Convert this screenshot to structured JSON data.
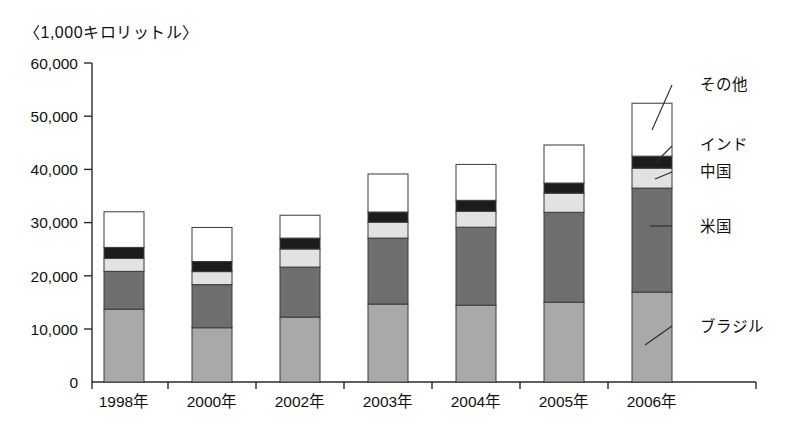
{
  "chart_data": {
    "type": "bar",
    "subtype": "stacked-bar",
    "title": "〈1,000キロリットル〉",
    "unit_note": "〈1,000キロリットル〉",
    "xlabel": "",
    "ylabel": "",
    "ylim": [
      0,
      60000
    ],
    "ytick_labels": [
      "60,000",
      "50,000",
      "40,000",
      "30,000",
      "20,000",
      "10,000",
      "0"
    ],
    "ytick_values": [
      60000,
      50000,
      40000,
      30000,
      20000,
      10000,
      0
    ],
    "grid": false,
    "legend_position": "right-callouts",
    "categories": [
      "1998年",
      "2000年",
      "2002年",
      "2003年",
      "2004年",
      "2005年",
      "2006年"
    ],
    "stack_order_bottom_to_top": [
      "ブラジル",
      "米国",
      "中国",
      "インド",
      "その他"
    ],
    "series": [
      {
        "name": "ブラジル",
        "color": "#a9a9a9",
        "values": [
          13700,
          10200,
          12200,
          14650,
          14450,
          15000,
          16900
        ]
      },
      {
        "name": "米国",
        "color": "#6e6e6e",
        "values": [
          7100,
          8100,
          9400,
          12400,
          14650,
          16900,
          19550
        ]
      },
      {
        "name": "中国",
        "color": "#e2e2e2",
        "values": [
          2450,
          2450,
          3400,
          3000,
          3000,
          3600,
          3750
        ]
      },
      {
        "name": "インド",
        "color": "#1c1c1c",
        "values": [
          2050,
          1900,
          2050,
          1900,
          2050,
          1900,
          2250
        ]
      },
      {
        "name": "その他",
        "color": "#ffffff",
        "values": [
          6700,
          6400,
          4300,
          7150,
          6750,
          7150,
          9950
        ]
      }
    ],
    "totals": [
      32000,
      29050,
      31350,
      39100,
      40900,
      44550,
      52400
    ],
    "callouts": [
      {
        "label": "その他",
        "x": 705,
        "y": 88
      },
      {
        "label": "インド",
        "x": 705,
        "y": 147
      },
      {
        "label": "中国",
        "x": 705,
        "y": 174
      },
      {
        "label": "米国",
        "x": 705,
        "y": 230
      },
      {
        "label": "ブラジル",
        "x": 705,
        "y": 330
      }
    ]
  },
  "axis": {
    "y_axis_x": 92,
    "baseline_y": 382,
    "top_y": 63,
    "px_per_10000": 53.2
  },
  "bars": {
    "width": 40,
    "left_positions": [
      104,
      192,
      280,
      368,
      456,
      544,
      632
    ]
  }
}
